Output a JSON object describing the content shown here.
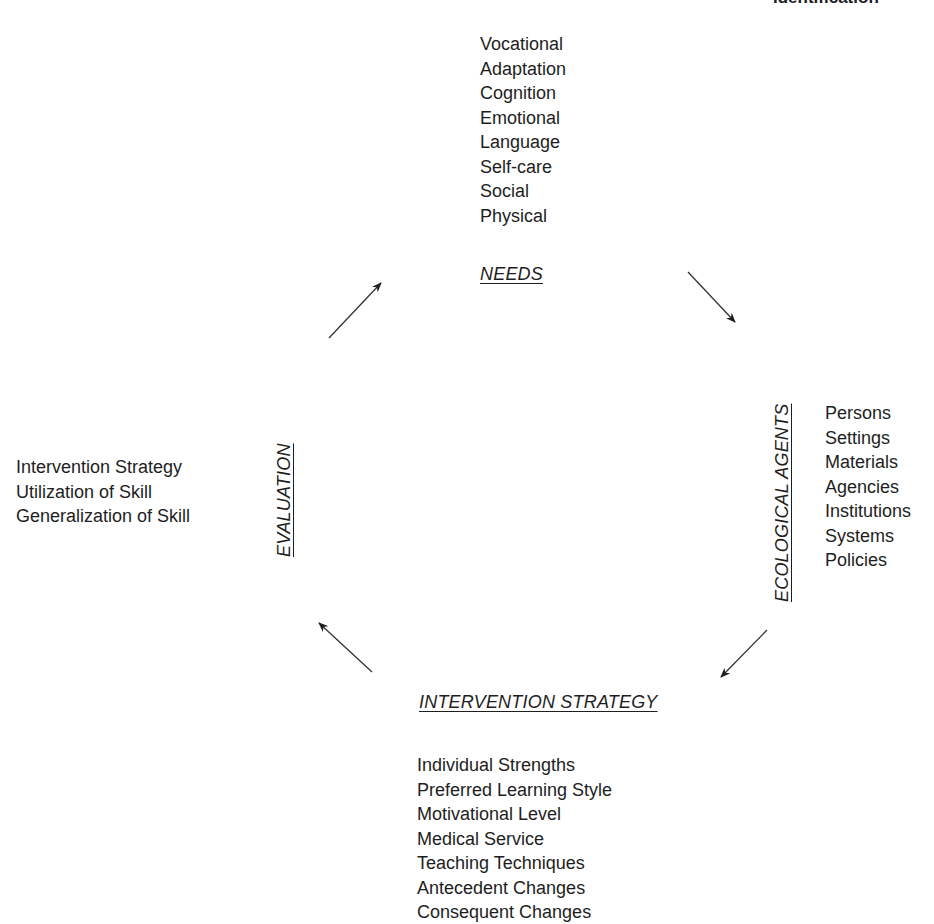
{
  "top_right_title": "Identification",
  "needs": {
    "heading": "NEEDS",
    "items": [
      "Vocational",
      "Adaptation",
      "Cognition",
      "Emotional",
      "Language",
      "Self-care",
      "Social",
      "Physical"
    ]
  },
  "ecological_agents": {
    "heading": "ECOLOGICAL AGENTS",
    "items": [
      "Persons",
      "Settings",
      "Materials",
      "Agencies",
      "Institutions",
      "Systems",
      "Policies"
    ]
  },
  "intervention_strategy": {
    "heading": "INTERVENTION STRATEGY",
    "items": [
      "Individual Strengths",
      "Preferred Learning Style",
      "Motivational Level",
      "Medical Service",
      "Teaching Techniques",
      "Antecedent Changes",
      "Consequent Changes"
    ]
  },
  "evaluation": {
    "heading": "EVALUATION",
    "items": [
      "Intervention Strategy",
      "Utilization of Skill",
      "Generalization of Skill"
    ]
  },
  "arrows": [
    {
      "name": "needs-to-ecological",
      "from": [
        688,
        272
      ],
      "to": [
        735,
        322
      ]
    },
    {
      "name": "ecological-to-intervention",
      "from": [
        767,
        630
      ],
      "to": [
        721,
        677
      ]
    },
    {
      "name": "intervention-to-evaluation",
      "from": [
        372,
        672
      ],
      "to": [
        319,
        623
      ]
    },
    {
      "name": "evaluation-to-needs",
      "from": [
        329,
        338
      ],
      "to": [
        381,
        283
      ]
    }
  ],
  "colors": {
    "ink": "#1e1e1e",
    "background": "#ffffff"
  }
}
